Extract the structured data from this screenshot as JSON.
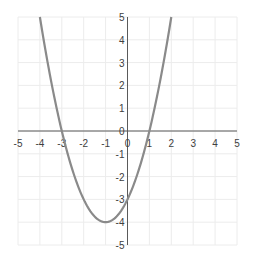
{
  "chart_data": {
    "type": "line",
    "title": "",
    "xlabel": "",
    "ylabel": "",
    "function": "y = x^2 + 2x - 3",
    "xlim": [
      -5,
      5
    ],
    "ylim": [
      -5,
      5
    ],
    "grid": true,
    "legend": null,
    "x_ticks": [
      -5,
      -4,
      -3,
      -2,
      -1,
      0,
      1,
      2,
      3,
      4,
      5
    ],
    "y_ticks": [
      -5,
      -4,
      -3,
      -2,
      -1,
      0,
      1,
      2,
      3,
      4,
      5
    ],
    "series": [
      {
        "name": "parabola",
        "color": "#808080",
        "x": [
          -4,
          -3.5,
          -3,
          -2.5,
          -2,
          -1.5,
          -1,
          -0.5,
          0,
          0.5,
          1,
          1.5,
          2
        ],
        "y": [
          5,
          1.25,
          0,
          -1.75,
          -3,
          -3.75,
          -4,
          -3.75,
          -3,
          -1.75,
          0,
          2.25,
          5
        ]
      }
    ],
    "annotations": {
      "roots": [
        -3,
        1
      ],
      "vertex": [
        -1,
        -4
      ],
      "y_intercept": -3
    }
  },
  "colors": {
    "curve": "#8a8a8a",
    "axis": "#5a5a5a",
    "grid": "#ececec",
    "tick_text": "#404040"
  }
}
